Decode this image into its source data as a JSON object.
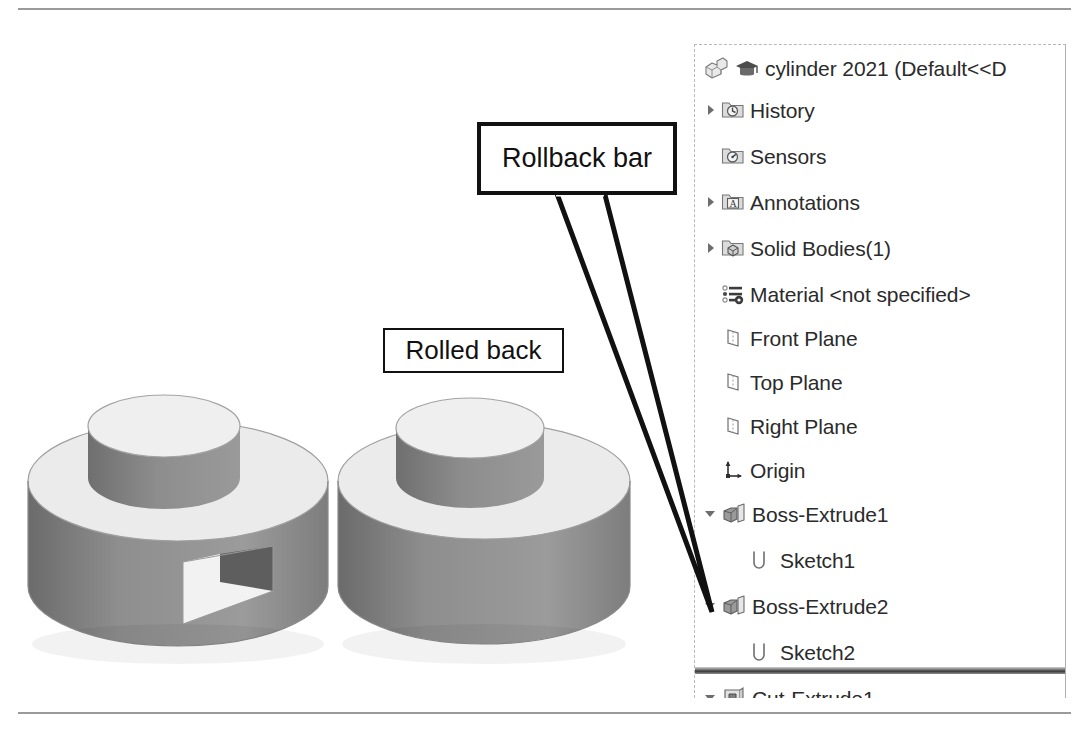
{
  "document": {
    "title": "cylinder 2021  (Default<<D",
    "icons": [
      "part-icon",
      "graduation-cap-icon"
    ]
  },
  "colors": {
    "rule": "#9a9a9a",
    "tree_text": "#2b2b2b",
    "callout_border": "#111111",
    "rollback_bar": "#3a3a3a",
    "model_top_face": "#e8e8e8",
    "model_side_face": "#8c8c8c",
    "model_side_dark": "#6f6f6f"
  },
  "tree": {
    "items": [
      {
        "label": "cylinder 2021  (Default<<D",
        "icon": "part-icon",
        "toggle": "none",
        "indent": 0,
        "top": 4
      },
      {
        "label": "History",
        "icon": "history-folder-icon",
        "toggle": "right",
        "indent": 0,
        "top": 46
      },
      {
        "label": "Sensors",
        "icon": "sensors-folder-icon",
        "toggle": "none",
        "indent": 0,
        "top": 92
      },
      {
        "label": "Annotations",
        "icon": "annotations-folder-icon",
        "toggle": "right",
        "indent": 0,
        "top": 138
      },
      {
        "label": "Solid Bodies(1)",
        "icon": "solid-bodies-folder-icon",
        "toggle": "right",
        "indent": 0,
        "top": 184
      },
      {
        "label": "Material <not specified>",
        "icon": "material-icon",
        "toggle": "none",
        "indent": 0,
        "top": 230
      },
      {
        "label": "Front Plane",
        "icon": "plane-icon",
        "toggle": "none",
        "indent": 0,
        "top": 274
      },
      {
        "label": "Top Plane",
        "icon": "plane-icon",
        "toggle": "none",
        "indent": 0,
        "top": 318
      },
      {
        "label": "Right Plane",
        "icon": "plane-icon",
        "toggle": "none",
        "indent": 0,
        "top": 362
      },
      {
        "label": "Origin",
        "icon": "origin-icon",
        "toggle": "none",
        "indent": 0,
        "top": 406
      },
      {
        "label": "Boss-Extrude1",
        "icon": "boss-extrude-icon",
        "toggle": "down",
        "indent": 0,
        "top": 450
      },
      {
        "label": "Sketch1",
        "icon": "sketch-icon",
        "toggle": "none",
        "indent": 1,
        "top": 496
      },
      {
        "label": "Boss-Extrude2",
        "icon": "boss-extrude-icon",
        "toggle": "down",
        "indent": 0,
        "top": 542
      },
      {
        "label": "Sketch2",
        "icon": "sketch-icon",
        "toggle": "none",
        "indent": 1,
        "top": 588
      },
      {
        "label": "Cut-Extrude1",
        "icon": "cut-extrude-icon",
        "toggle": "down",
        "indent": 0,
        "top": 634
      },
      {
        "label": "Sketch3",
        "icon": "sketch-icon",
        "toggle": "none",
        "indent": 1,
        "top": 680
      }
    ],
    "rollback_bar_top": 622
  },
  "annotations": {
    "rollback_bar_label": "Rollback bar",
    "rolled_back_label": "Rolled back"
  },
  "models": [
    {
      "name": "cylinder-with-cut",
      "caption": "",
      "has_cut": true
    },
    {
      "name": "cylinder-rolled-back",
      "caption": "Rolled back",
      "has_cut": false
    }
  ]
}
